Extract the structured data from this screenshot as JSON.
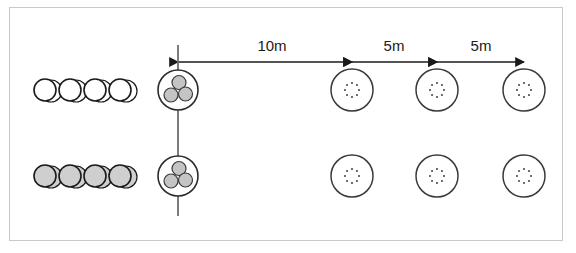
{
  "figure": {
    "title": "",
    "background_color": "#ffffff",
    "border_color": "#c9c9c9",
    "stroke_color": "#1a1a1a",
    "cone_fill_top": "#ffffff",
    "cone_fill_bottom": "#cfcfcf",
    "cluster_dot_fill": "#c4c4c4"
  },
  "dimensions": [
    {
      "id": "dim-10m",
      "label": "10m",
      "x": 272,
      "y": 38,
      "from_x": 178,
      "to_x": 352,
      "arrow_y": 62,
      "style": "double-headed"
    },
    {
      "id": "dim-5m-1",
      "label": "5m",
      "x": 394,
      "y": 38,
      "from_x": 352,
      "to_x": 437,
      "arrow_y": 62,
      "style": "double-headed"
    },
    {
      "id": "dim-5m-2",
      "label": "5m",
      "x": 481,
      "y": 38,
      "from_x": 437,
      "to_x": 524,
      "arrow_y": 62,
      "style": "double-headed"
    }
  ],
  "start_line": {
    "id": "start-line",
    "x": 178,
    "y_top": 45,
    "y_bottom": 216
  },
  "rows": [
    {
      "id": "row-top",
      "center_y": 90,
      "player_group": {
        "id": "player-group-top",
        "fill": "#ffffff",
        "count": 4,
        "radius": 11,
        "start_x": 45,
        "spacing": 25
      },
      "cluster": {
        "id": "cluster-top",
        "cx": 178,
        "cy": 90,
        "outer_radius": 20,
        "dot_radius": 7,
        "dot_count": 3
      },
      "markers": [
        {
          "id": "marker-top-1",
          "cx": 352,
          "cy": 90,
          "radius": 21,
          "inner_radius": 7,
          "inner_dots": 8
        },
        {
          "id": "marker-top-2",
          "cx": 437,
          "cy": 90,
          "radius": 21,
          "inner_radius": 7,
          "inner_dots": 8
        },
        {
          "id": "marker-top-3",
          "cx": 524,
          "cy": 90,
          "radius": 21,
          "inner_radius": 7,
          "inner_dots": 8
        }
      ]
    },
    {
      "id": "row-bottom",
      "center_y": 176,
      "player_group": {
        "id": "player-group-bottom",
        "fill": "#cfcfcf",
        "count": 4,
        "radius": 11,
        "start_x": 45,
        "spacing": 25
      },
      "cluster": {
        "id": "cluster-bottom",
        "cx": 178,
        "cy": 176,
        "outer_radius": 20,
        "dot_radius": 7,
        "dot_count": 3
      },
      "markers": [
        {
          "id": "marker-bottom-1",
          "cx": 352,
          "cy": 176,
          "radius": 21,
          "inner_radius": 7,
          "inner_dots": 8
        },
        {
          "id": "marker-bottom-2",
          "cx": 437,
          "cy": 176,
          "radius": 21,
          "inner_radius": 7,
          "inner_dots": 8
        },
        {
          "id": "marker-bottom-3",
          "cx": 524,
          "cy": 176,
          "radius": 21,
          "inner_radius": 7,
          "inner_dots": 8
        }
      ]
    }
  ]
}
